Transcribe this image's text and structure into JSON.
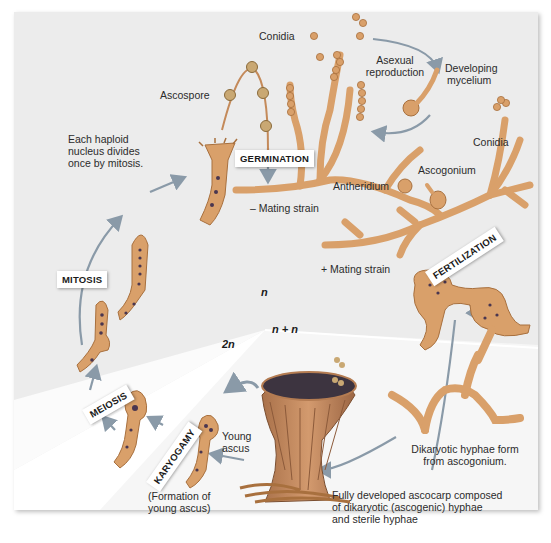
{
  "figure": {
    "colors": {
      "panel_bg": "#ececec",
      "diploid_region": "#ffffff",
      "dikaryon_region": "#f7f7f7",
      "hypha_fill": "#d9a06a",
      "hypha_stroke": "#a8703e",
      "nucleus": "#4a3650",
      "spore_fill": "#c9a873",
      "arrow": "#8a9aa8",
      "cup_outer": "#c4865a",
      "cup_inner": "#3d3440"
    }
  },
  "labels": {
    "conidia_top": "Conidia",
    "asexual_reproduction_1": "Asexual",
    "asexual_reproduction_2": "reproduction",
    "developing_mycelium_1": "Developing",
    "developing_mycelium_2": "mycelium",
    "ascospore": "Ascospore",
    "haploid_divides_1": "Each haploid",
    "haploid_divides_2": "nucleus divides",
    "haploid_divides_3": "once by mitosis.",
    "conidia_right": "Conidia",
    "ascogonium": "Ascogonium",
    "antheridium": "Antheridium",
    "minus_mating": "– Mating strain",
    "plus_mating": "+ Mating strain",
    "young_ascus_1": "Young",
    "young_ascus_2": "ascus",
    "formation_1": "(Formation of",
    "formation_2": "young ascus)",
    "dikaryotic_form_1": "Dikaryotic hyphae form",
    "dikaryotic_form_2": "from ascogonium.",
    "ascocarp_1": "Fully developed ascocarp composed",
    "ascocarp_2": "of dikaryotic (ascogenic) hyphae",
    "ascocarp_3": "and sterile hyphae"
  },
  "stages": {
    "germination": "GERMINATION",
    "fertilization": "FERTILIZATION",
    "mitosis": "MITOSIS",
    "meiosis": "MEIOSIS",
    "karyogamy": "KARYOGAMY"
  },
  "ploidy": {
    "haploid": "n",
    "dikaryon": "n + n",
    "diploid": "2n"
  }
}
